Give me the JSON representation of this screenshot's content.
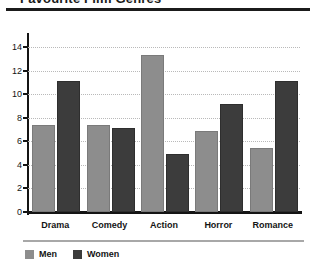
{
  "page": {
    "title_partial": "Favourite Film Genres"
  },
  "legend": {
    "items": [
      {
        "label": "Men",
        "color": "#8d8d8d"
      },
      {
        "label": "Women",
        "color": "#3c3c3c"
      }
    ]
  },
  "chart_data": {
    "type": "bar",
    "title": "Favourite Film Genres",
    "xlabel": "",
    "ylabel": "",
    "categories": [
      "Drama",
      "Comedy",
      "Action",
      "Horror",
      "Romance"
    ],
    "series": [
      {
        "name": "Men",
        "color": "#8d8d8d",
        "values": [
          7.2,
          7.2,
          13.2,
          6.7,
          5.3
        ]
      },
      {
        "name": "Women",
        "color": "#3c3c3c",
        "values": [
          11.0,
          7.0,
          4.8,
          9.0,
          11.0
        ]
      }
    ],
    "ylim": [
      0,
      14.8
    ],
    "yticks": [
      0,
      2,
      4,
      6,
      8,
      10,
      12,
      14
    ],
    "ytick_labels": [
      "0",
      "2",
      "4",
      "6",
      "8",
      "10",
      "12",
      "14"
    ],
    "grid": true,
    "grid_style": "dotted",
    "legend_position": "bottom-left"
  }
}
